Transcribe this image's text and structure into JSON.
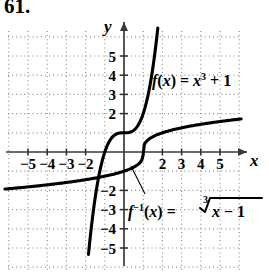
{
  "problem": {
    "number": "61."
  },
  "chart_data": {
    "type": "line",
    "title": "",
    "xlabel": "x",
    "ylabel": "y",
    "xlim": [
      -6.2,
      6.2
    ],
    "ylim": [
      -6.3,
      6.3
    ],
    "grid": true,
    "grid_style": "dotted",
    "axes_arrows": [
      "x-positive",
      "y-positive"
    ],
    "legend": "inline-annotations",
    "xticks": [
      -5,
      -4,
      -3,
      -2,
      2,
      3,
      4,
      5
    ],
    "xtick_labels": [
      "−5",
      "−4",
      "−3",
      "−2",
      "2",
      "3",
      "4",
      "5"
    ],
    "yticks": [
      5,
      4,
      3,
      2,
      -2,
      -3,
      -4,
      -5
    ],
    "ytick_labels": [
      "5",
      "4",
      "3",
      "2",
      "−2",
      "−3",
      "−4",
      "−5"
    ],
    "series": [
      {
        "name": "f",
        "label": "f(x) = x³ + 1",
        "expression": "x^3 + 1",
        "x": [
          -1.85,
          -1.7,
          -1.5,
          -1.3,
          -1.1,
          -0.9,
          -0.7,
          -0.5,
          -0.3,
          -0.1,
          0.1,
          0.3,
          0.5,
          0.7,
          0.9,
          1.1,
          1.3,
          1.5,
          1.7,
          1.76
        ],
        "y": [
          -5.33,
          -3.91,
          -2.38,
          -1.2,
          -0.33,
          0.27,
          0.66,
          0.88,
          0.97,
          1.0,
          1.0,
          1.03,
          1.13,
          1.34,
          1.73,
          2.33,
          3.2,
          4.38,
          5.91,
          6.45
        ]
      },
      {
        "name": "f-inverse",
        "label": "f⁻¹(x) = ∛(x − 1)",
        "expression": "cbrt(x - 1)",
        "x": [
          -6.2,
          -5.0,
          -4.0,
          -3.0,
          -2.0,
          -1.0,
          0.0,
          0.5,
          0.9,
          1.0,
          1.1,
          1.5,
          2.0,
          3.0,
          4.0,
          5.0,
          6.1
        ],
        "y": [
          -1.93,
          -1.82,
          -1.71,
          -1.59,
          -1.44,
          -1.26,
          -1.0,
          -0.79,
          -0.46,
          0.0,
          0.46,
          0.79,
          1.0,
          1.26,
          1.44,
          1.59,
          1.71
        ]
      }
    ],
    "annotations": [
      {
        "name": "f-label",
        "text": "f(x) = x³ + 1",
        "at": [
          1.7,
          3.4
        ]
      },
      {
        "name": "f-inverse-label",
        "text": "f⁻¹(x) = ∛x − 1",
        "at": [
          0.4,
          -3.1
        ],
        "leader_to": [
          0.55,
          -0.72
        ]
      }
    ]
  },
  "labels": {
    "x_axis": "x",
    "y_axis": "y",
    "f_fn": "f",
    "f_paren": "(x) = ",
    "f_var": "x",
    "f_exp": "3",
    "f_tail": " + 1",
    "finv_fn": "f",
    "finv_exp": "−1",
    "finv_paren": "(x) = ",
    "radical_index": "3",
    "radicand": "x − 1"
  },
  "colors": {
    "curve": "#000000",
    "axis": "#3a3a3a",
    "grid": "#8e8e8e",
    "background": "#ffffff"
  }
}
